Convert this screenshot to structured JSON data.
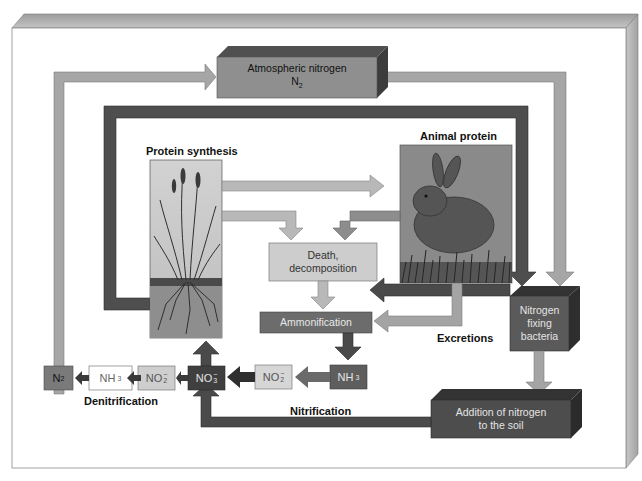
{
  "diagram": {
    "colors": {
      "light_arrow": "#a9a9a9",
      "medium_arrow": "#8a8a8a",
      "dark_arrow": "#4a4a4a",
      "frame": "#b4b4b4",
      "box_light": "#cfcfcf",
      "box_medium": "#6f6f6f",
      "box_dark": "#444444"
    },
    "nodes": {
      "atmospheric": {
        "line1": "Atmospheric nitrogen",
        "line2": "N",
        "sub": "2"
      },
      "protein_synthesis": {
        "label": "Protein synthesis"
      },
      "animal_protein": {
        "label": "Animal protein"
      },
      "death": {
        "line1": "Death,",
        "line2": "decomposition"
      },
      "ammonification": {
        "label": "Ammonification"
      },
      "excretions": {
        "label": "Excretions"
      },
      "nitrogen_fixing": {
        "line1": "Nitrogen",
        "line2": "fixing",
        "line3": "bacteria"
      },
      "addition_soil": {
        "line1": "Addition of nitrogen",
        "line2": "to the soil"
      },
      "denitrification": {
        "label": "Denitrification"
      },
      "nitrification": {
        "label": "Nitrification"
      }
    },
    "chain": [
      {
        "id": "n2",
        "base": "N",
        "sub": "2",
        "charge": ""
      },
      {
        "id": "nh3-left",
        "base": "NH",
        "sub": "3",
        "charge": ""
      },
      {
        "id": "no2-left",
        "base": "NO",
        "sub": "2",
        "charge": "−"
      },
      {
        "id": "no3",
        "base": "NO",
        "sub": "3",
        "charge": "−"
      },
      {
        "id": "no2-right",
        "base": "NO",
        "sub": "2",
        "charge": "−"
      },
      {
        "id": "nh3-right",
        "base": "NH",
        "sub": "3",
        "charge": ""
      }
    ]
  }
}
